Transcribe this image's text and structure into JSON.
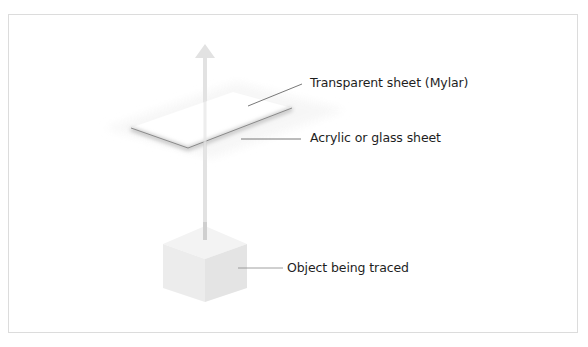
{
  "diagram": {
    "type": "light-tracing setup (exploded view)",
    "labels": {
      "mylar": "Transparent sheet (Mylar)",
      "acrylic": "Acrylic or glass sheet",
      "object": "Object being traced"
    },
    "colors": {
      "frame_border": "#dcdcdc",
      "leader_line": "#555555",
      "arrow": "#e2e2e2",
      "cube_top": "#f3f3f3",
      "cube_left": "#ececec",
      "cube_right": "#e3e3e3",
      "sheet": "#ffffff",
      "sheet_edge": "#8a8a8a",
      "text": "#1e1e1e"
    }
  }
}
